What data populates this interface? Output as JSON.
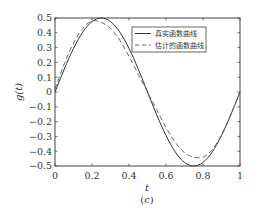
{
  "chart_data": {
    "type": "line",
    "title": "",
    "caption": "(c)",
    "xlabel": "t",
    "ylabel": "g(t)",
    "xlim": [
      0,
      1
    ],
    "ylim": [
      -0.5,
      0.5
    ],
    "grid": false,
    "legend_position": "upper right",
    "x_ticks": [
      "0",
      "0.2",
      "0.4",
      "0.6",
      "0.8",
      "1"
    ],
    "x_tick_values": [
      0,
      0.2,
      0.4,
      0.6,
      0.8,
      1.0
    ],
    "y_ticks": [
      "0.5",
      "0.4",
      "0.3",
      "0.2",
      "0.1",
      "0",
      "-0.1",
      "-0.2",
      "-0.3",
      "-0.4",
      "-0.5"
    ],
    "y_tick_values": [
      0.5,
      0.4,
      0.3,
      0.2,
      0.1,
      0,
      -0.1,
      -0.2,
      -0.3,
      -0.4,
      -0.5
    ],
    "x": [
      0,
      0.05,
      0.1,
      0.15,
      0.2,
      0.25,
      0.3,
      0.35,
      0.4,
      0.45,
      0.5,
      0.55,
      0.6,
      0.65,
      0.7,
      0.75,
      0.8,
      0.85,
      0.9,
      0.95,
      1.0
    ],
    "series": [
      {
        "name": "真实函数曲线",
        "style": "solid",
        "color": "#333333",
        "values": [
          0,
          0.155,
          0.294,
          0.405,
          0.476,
          0.5,
          0.476,
          0.405,
          0.294,
          0.155,
          0,
          -0.155,
          -0.294,
          -0.405,
          -0.476,
          -0.5,
          -0.476,
          -0.405,
          -0.294,
          -0.155,
          0
        ]
      },
      {
        "name": "估计的函数曲线",
        "style": "dashed",
        "color": "#666666",
        "values": [
          0.02,
          0.19,
          0.33,
          0.43,
          0.48,
          0.47,
          0.43,
          0.35,
          0.24,
          0.12,
          0,
          -0.12,
          -0.24,
          -0.34,
          -0.41,
          -0.44,
          -0.44,
          -0.39,
          -0.29,
          -0.15,
          0
        ]
      }
    ]
  },
  "legend": {
    "items": [
      {
        "label": "真实函数曲线",
        "style": "solid"
      },
      {
        "label": "估计的函数曲线",
        "style": "dashed"
      }
    ]
  }
}
